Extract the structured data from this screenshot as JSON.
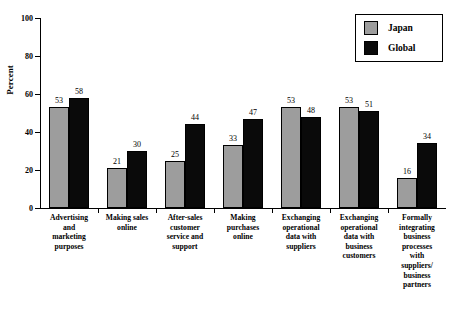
{
  "chart_data": {
    "type": "bar",
    "title": "",
    "xlabel": "",
    "ylabel": "Percent",
    "ylim": [
      0,
      100
    ],
    "yticks": [
      0,
      20,
      40,
      60,
      80,
      100
    ],
    "grid": false,
    "legend_position": "top-right",
    "categories": [
      "Advertising and marketing purposes",
      "Making sales online",
      "After-sales customer service and support",
      "Making purchases online",
      "Exchanging operational data with suppliers",
      "Exchanging operational data with business customers",
      "Formally integrating business processes with suppliers/ business partners"
    ],
    "category_lines": [
      [
        "Advertising",
        "and",
        "marketing",
        "purposes"
      ],
      [
        "Making sales",
        "online"
      ],
      [
        "After-sales",
        "customer",
        "service and",
        "support"
      ],
      [
        "Making",
        "purchases",
        "online"
      ],
      [
        "Exchanging",
        "operational",
        "data with",
        "suppliers"
      ],
      [
        "Exchanging",
        "operational",
        "data with",
        "business",
        "customers"
      ],
      [
        "Formally",
        "integrating",
        "business",
        "processes",
        "with",
        "suppliers/",
        "business",
        "partners"
      ]
    ],
    "series": [
      {
        "name": "Japan",
        "color": "#9d9d9d",
        "values": [
          53,
          21,
          25,
          33,
          53,
          53,
          16
        ]
      },
      {
        "name": "Global",
        "color": "#0a0a0a",
        "values": [
          58,
          30,
          44,
          47,
          48,
          51,
          34
        ]
      }
    ]
  },
  "legend": {
    "items": [
      {
        "label": "Japan"
      },
      {
        "label": "Global"
      }
    ]
  },
  "caption": {
    "text": ""
  }
}
